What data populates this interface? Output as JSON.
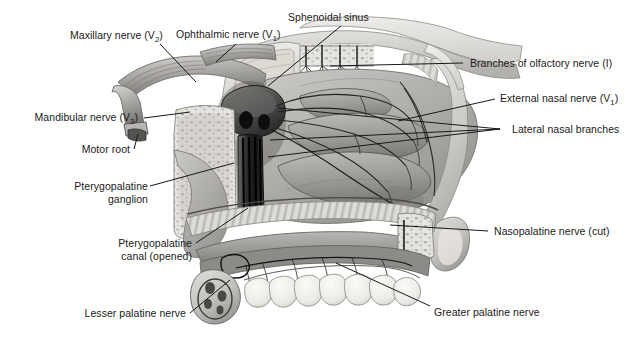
{
  "figure": {
    "type": "anatomical-illustration",
    "palette": {
      "background": "#ffffff",
      "ink": "#16181a",
      "tissue_light": "#cfcdc9",
      "tissue_mid": "#a8a6a3",
      "tissue_dark": "#6f6e6c",
      "bone_pale": "#e4e2de",
      "nerve_black": "#141414",
      "tooth": "#f2f1ec"
    }
  },
  "labels": {
    "maxillary_nerve": {
      "text_pre": "Maxillary nerve (V",
      "sub": "2",
      "text_post": ")",
      "side": "top-left"
    },
    "ophthalmic_nerve": {
      "text_pre": "Ophthalmic nerve (V",
      "sub": "1",
      "text_post": ")",
      "side": "top-center"
    },
    "sphenoidal_sinus": {
      "text": "Sphenoidal sinus",
      "side": "top-center"
    },
    "branches_olfactory": {
      "text": "Branches of olfactory nerve (I)",
      "side": "right"
    },
    "external_nasal": {
      "text_pre": "External nasal nerve (V",
      "sub": "1",
      "text_post": ")",
      "side": "right"
    },
    "lateral_nasal": {
      "text": "Lateral nasal branches",
      "side": "right"
    },
    "nasopalatine": {
      "text": "Nasopalatine nerve (cut)",
      "side": "right"
    },
    "greater_palatine": {
      "text": "Greater palatine nerve",
      "side": "bottom-right"
    },
    "lesser_palatine": {
      "text": "Lesser palatine nerve",
      "side": "bottom-left"
    },
    "pterygopalatine_canal": {
      "line1": "Pterygopalatine",
      "line2": "canal (opened)",
      "side": "left"
    },
    "pterygopalatine_ganglion": {
      "line1": "Pterygopalatine",
      "line2": "ganglion",
      "side": "left"
    },
    "motor_root": {
      "text": "Motor root",
      "side": "left"
    },
    "mandibular_nerve": {
      "text_pre": "Mandibular nerve (V",
      "sub": "3",
      "text_post": ")",
      "side": "left"
    }
  }
}
